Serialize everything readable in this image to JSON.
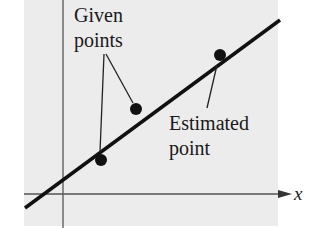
{
  "diagram": {
    "panel_color": "#ececec",
    "ink_color": "#111111",
    "axis_color": "#555555",
    "x_axis_label": "x",
    "labels": {
      "given_line1": "Given",
      "given_line2": "points",
      "estimated_line1": "Estimated",
      "estimated_line2": "point"
    },
    "points": [
      {
        "name": "given-point-1",
        "cx": 101,
        "cy": 160
      },
      {
        "name": "given-point-2",
        "cx": 136,
        "cy": 109
      },
      {
        "name": "estimated-point",
        "cx": 220,
        "cy": 55
      }
    ]
  }
}
